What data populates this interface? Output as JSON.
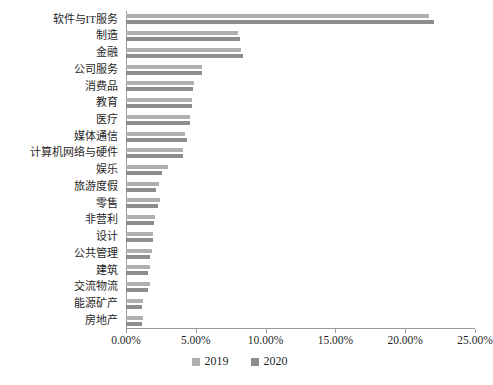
{
  "chart_data": {
    "type": "bar",
    "orientation": "horizontal",
    "title": "",
    "xlabel": "",
    "ylabel": "",
    "xlim": [
      0,
      25
    ],
    "xticks": [
      "0.00%",
      "5.00%",
      "10.00%",
      "15.00%",
      "20.00%",
      "25.00%"
    ],
    "xtick_values": [
      0,
      5,
      10,
      15,
      20,
      25
    ],
    "grid": false,
    "legend_position": "bottom",
    "categories": [
      "软件与IT服务",
      "制造",
      "金融",
      "公司服务",
      "消费品",
      "教育",
      "医疗",
      "媒体通信",
      "计算机网络与硬件",
      "娱乐",
      "旅游度假",
      "零售",
      "非营利",
      "设计",
      "公共管理",
      "建筑",
      "交流物流",
      "能源矿产",
      "房地产"
    ],
    "series": [
      {
        "name": "2019",
        "color": "#b0b0b0",
        "values": [
          21.7,
          8.05,
          8.25,
          5.45,
          4.85,
          4.7,
          4.6,
          4.25,
          4.05,
          3.0,
          2.35,
          2.45,
          2.1,
          1.95,
          1.85,
          1.7,
          1.7,
          1.25,
          1.25
        ]
      },
      {
        "name": "2020",
        "color": "#8d8d8d",
        "values": [
          22.05,
          8.2,
          8.4,
          5.45,
          4.8,
          4.75,
          4.6,
          4.35,
          4.1,
          2.55,
          2.15,
          2.3,
          2.0,
          1.9,
          1.7,
          1.6,
          1.55,
          1.15,
          1.15
        ]
      }
    ]
  },
  "legend": {
    "items": [
      {
        "label": "2019",
        "color": "#b0b0b0"
      },
      {
        "label": "2020",
        "color": "#8d8d8d"
      }
    ]
  }
}
